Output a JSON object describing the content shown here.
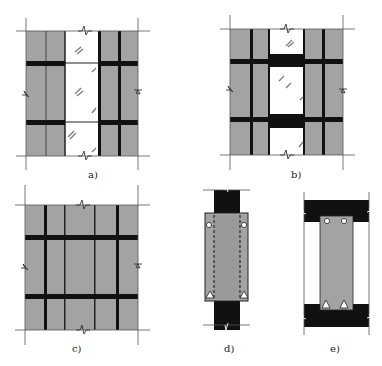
{
  "colors": {
    "gray": "#a3a3a3",
    "black": "#111111",
    "line": "#444444",
    "hatch": "#7a7a7a",
    "white": "#ffffff"
  },
  "labels": {
    "a": "a)",
    "b": "b)",
    "c": "c)",
    "d": "d)",
    "e": "e)"
  },
  "panels": [
    {
      "id": "a",
      "description": "Wall with glazed opening, columns on both sides, spandrel bands interrupted at opening"
    },
    {
      "id": "b",
      "description": "Wall with glazed opening, spandrel bands continuous through opening as solid beams"
    },
    {
      "id": "c",
      "description": "Solid infill wall with continuous columns and spandrel bands"
    },
    {
      "id": "d",
      "description": "Panel section hung between column, dashed reinforcement, circles at top, triangles at bottom"
    },
    {
      "id": "e",
      "description": "Panel section between floor slabs, circles at top, triangles at bottom"
    }
  ]
}
